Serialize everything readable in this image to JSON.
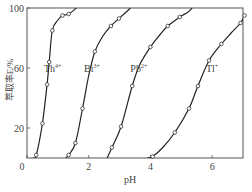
{
  "chart_data": {
    "type": "line",
    "title": "",
    "xlabel": "pH",
    "ylabel": "萃取率E/%",
    "xlim": [
      0,
      7
    ],
    "ylim": [
      0,
      100
    ],
    "xticks": [
      0,
      2,
      4,
      6
    ],
    "xtick_labels": [
      "0",
      "2",
      "4",
      "6"
    ],
    "yticks": [
      20,
      60,
      100
    ],
    "ytick_labels": [
      "20",
      "60",
      "100"
    ],
    "grid": false,
    "legend": "inline labels",
    "series": [
      {
        "name": "Th4+",
        "label": "Th",
        "charge": "4+",
        "label_pos": [
          0.55,
          60
        ],
        "points": [
          [
            0.3,
            2
          ],
          [
            0.5,
            23
          ],
          [
            0.65,
            49
          ],
          [
            0.72,
            64
          ],
          [
            0.82,
            85
          ],
          [
            1.15,
            95
          ],
          [
            1.35,
            96
          ]
        ],
        "curve": [
          [
            0.2,
            0
          ],
          [
            0.3,
            2
          ],
          [
            0.5,
            23
          ],
          [
            0.65,
            49
          ],
          [
            0.72,
            64
          ],
          [
            0.82,
            85
          ],
          [
            1.0,
            92
          ],
          [
            1.15,
            95
          ],
          [
            1.35,
            96
          ],
          [
            1.6,
            100
          ]
        ]
      },
      {
        "name": "Bi3+",
        "label": "Bi",
        "charge": "3+",
        "label_pos": [
          1.85,
          60
        ],
        "points": [
          [
            1.35,
            2
          ],
          [
            1.57,
            10
          ],
          [
            1.8,
            33
          ],
          [
            2.2,
            71
          ],
          [
            2.72,
            88
          ],
          [
            2.98,
            93
          ]
        ],
        "curve": [
          [
            1.25,
            0
          ],
          [
            1.35,
            2
          ],
          [
            1.57,
            10
          ],
          [
            1.8,
            33
          ],
          [
            2.0,
            55
          ],
          [
            2.2,
            71
          ],
          [
            2.45,
            81
          ],
          [
            2.72,
            88
          ],
          [
            2.98,
            93
          ],
          [
            3.2,
            97
          ],
          [
            3.35,
            100
          ]
        ]
      },
      {
        "name": "Pb2+",
        "label": "Pb",
        "charge": "2+",
        "label_pos": [
          3.35,
          60
        ],
        "points": [
          [
            2.75,
            7
          ],
          [
            3.05,
            21
          ],
          [
            3.41,
            48
          ],
          [
            4.0,
            74
          ],
          [
            4.56,
            88
          ],
          [
            4.95,
            94
          ]
        ],
        "curve": [
          [
            2.6,
            0
          ],
          [
            2.75,
            7
          ],
          [
            3.05,
            21
          ],
          [
            3.41,
            48
          ],
          [
            3.65,
            62
          ],
          [
            4.0,
            74
          ],
          [
            4.3,
            82
          ],
          [
            4.56,
            88
          ],
          [
            4.95,
            94
          ],
          [
            5.2,
            97
          ],
          [
            5.35,
            100
          ]
        ]
      },
      {
        "name": "Tl+",
        "label": "Tl",
        "charge": "+",
        "label_pos": [
          5.8,
          60
        ],
        "points": [
          [
            4.07,
            1
          ],
          [
            4.79,
            17
          ],
          [
            5.25,
            33
          ],
          [
            5.54,
            48
          ],
          [
            5.9,
            65
          ],
          [
            6.3,
            76
          ],
          [
            6.92,
            90
          ],
          [
            7.05,
            95
          ]
        ],
        "curve": [
          [
            3.9,
            0
          ],
          [
            4.07,
            1
          ],
          [
            4.4,
            7
          ],
          [
            4.79,
            17
          ],
          [
            5.25,
            33
          ],
          [
            5.54,
            48
          ],
          [
            5.9,
            65
          ],
          [
            6.3,
            76
          ],
          [
            6.6,
            83
          ],
          [
            6.92,
            90
          ],
          [
            7.05,
            95
          ],
          [
            7.1,
            98
          ]
        ]
      }
    ]
  }
}
